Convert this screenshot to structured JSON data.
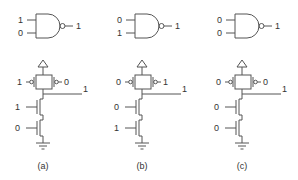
{
  "figure": {
    "panels": [
      {
        "caption": "(a)",
        "gate": {
          "type": "NAND",
          "input_a": "1",
          "input_b": "0",
          "output": "1"
        },
        "cmos": {
          "pmos_left_gate": "1",
          "pmos_right_gate": "0",
          "output": "1",
          "nmos_top_gate": "1",
          "nmos_bottom_gate": "0"
        }
      },
      {
        "caption": "(b)",
        "gate": {
          "type": "NAND",
          "input_a": "0",
          "input_b": "1",
          "output": "1"
        },
        "cmos": {
          "pmos_left_gate": "0",
          "pmos_right_gate": "1",
          "output": "1",
          "nmos_top_gate": "0",
          "nmos_bottom_gate": "1"
        }
      },
      {
        "caption": "(c)",
        "gate": {
          "type": "NAND",
          "input_a": "0",
          "input_b": "0",
          "output": "1"
        },
        "cmos": {
          "pmos_left_gate": "0",
          "pmos_right_gate": "0",
          "output": "1",
          "nmos_top_gate": "0",
          "nmos_bottom_gate": "0"
        }
      }
    ]
  }
}
